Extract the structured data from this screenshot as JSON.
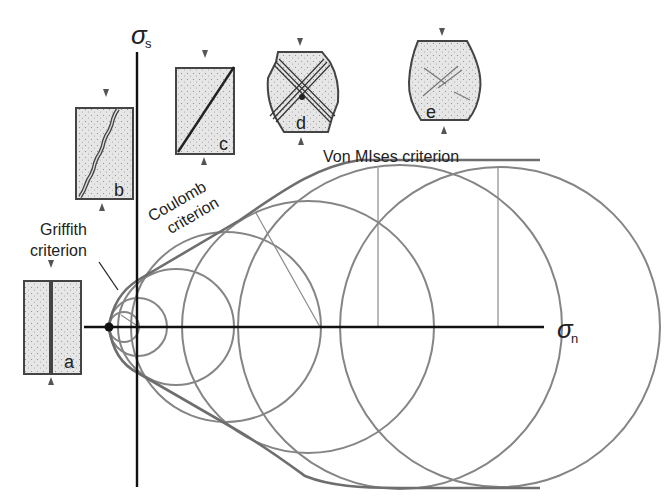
{
  "figure": {
    "axes": {
      "vertical_symbol": "σ",
      "vertical_subscript": "s",
      "horizontal_symbol": "σ",
      "horizontal_subscript": "n"
    },
    "criteria": {
      "griffith_line1": "Griffith",
      "griffith_line2": "criterion",
      "coulomb_line1": "Coulomb",
      "coulomb_line2": "criterion",
      "von_mises": "Von MIses criterion"
    },
    "specimens": [
      {
        "id": "a",
        "label": "a",
        "failure": "tensile vertical fracture"
      },
      {
        "id": "b",
        "label": "b",
        "failure": "wavy inclined fracture"
      },
      {
        "id": "c",
        "label": "c",
        "failure": "straight shear fracture"
      },
      {
        "id": "d",
        "label": "d",
        "failure": "conjugate shear bands, bulging"
      },
      {
        "id": "e",
        "label": "e",
        "failure": "ductile barrel-shaped deformation"
      }
    ],
    "colors": {
      "axis": "#111111",
      "circle": "#808080",
      "envelope": "#707070",
      "specimen_fill": "#e2e2e2",
      "specimen_stroke": "#444444"
    }
  }
}
